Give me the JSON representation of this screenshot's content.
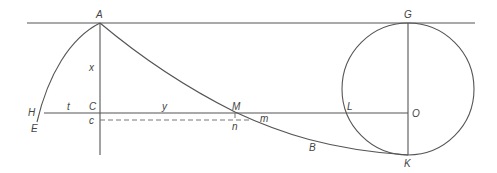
{
  "diagram": {
    "type": "geometric construction (cycloid / tractrix with generating circle)",
    "colors": {
      "line": "#555555",
      "dashed": "#777777",
      "label": "#444444",
      "background": "#ffffff"
    },
    "labels": {
      "A": "A",
      "G": "G",
      "x": "x",
      "H": "H",
      "E": "E",
      "t": "t",
      "C": "C",
      "c": "c",
      "y": "y",
      "M": "M",
      "n": "n",
      "m": "m",
      "L": "L",
      "O": "O",
      "B": "B",
      "K": "K"
    },
    "points": {
      "A": [
        100,
        23
      ],
      "G": [
        408,
        23
      ],
      "O": [
        408,
        89
      ],
      "K": [
        408,
        155
      ],
      "C": [
        100,
        113
      ],
      "c": [
        100,
        120
      ],
      "M": [
        235,
        113
      ],
      "n": [
        235,
        120
      ],
      "m": [
        254,
        120
      ],
      "L": [
        343,
        113
      ],
      "H": [
        40,
        113
      ],
      "E": [
        37,
        122
      ]
    },
    "circle": {
      "center": "O",
      "radius": 66
    }
  }
}
